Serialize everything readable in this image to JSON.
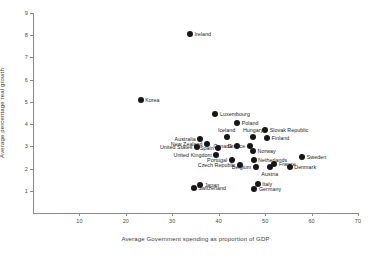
{
  "chart_data": {
    "type": "scatter",
    "title": "",
    "xlabel": "Average Government spending as proportion of GDP",
    "ylabel": "Average percentage real growth",
    "xlim": [
      0,
      70
    ],
    "ylim": [
      0,
      9
    ],
    "xticks": [
      10,
      20,
      30,
      40,
      50,
      60,
      70
    ],
    "yticks": [
      1,
      2,
      3,
      4,
      5,
      6,
      7,
      8,
      9
    ],
    "grid": false,
    "legend": "none",
    "marker": "filled-circle",
    "marker_color": "#161616",
    "points": [
      {
        "label": "Ireland",
        "x": 33.8,
        "y": 8.05,
        "lpos": "right"
      },
      {
        "label": "Korea",
        "x": 23.2,
        "y": 5.1,
        "lpos": "right"
      },
      {
        "label": "Luxembourg",
        "x": 39.3,
        "y": 4.45,
        "lpos": "right"
      },
      {
        "label": "Poland",
        "x": 44.0,
        "y": 4.05,
        "lpos": "right"
      },
      {
        "label": "Slovak Republic",
        "x": 50.0,
        "y": 3.72,
        "lpos": "right"
      },
      {
        "label": "Hungary",
        "x": 47.4,
        "y": 3.4,
        "lpos": "top"
      },
      {
        "label": "Finland",
        "x": 50.4,
        "y": 3.38,
        "lpos": "right"
      },
      {
        "label": "Iceland",
        "x": 41.7,
        "y": 3.42,
        "lpos": "top"
      },
      {
        "label": "Australia",
        "x": 36.0,
        "y": 3.32,
        "lpos": "left"
      },
      {
        "label": "New Zealand",
        "x": 37.5,
        "y": 3.12,
        "lpos": "left"
      },
      {
        "label": "United States",
        "x": 35.3,
        "y": 2.95,
        "lpos": "left"
      },
      {
        "label": "Spain",
        "x": 39.9,
        "y": 2.92,
        "lpos": "left"
      },
      {
        "label": "Canada",
        "x": 43.9,
        "y": 3.0,
        "lpos": "left"
      },
      {
        "label": "Greece",
        "x": 46.7,
        "y": 3.02,
        "lpos": "left"
      },
      {
        "label": "Norway",
        "x": 47.4,
        "y": 2.78,
        "lpos": "right"
      },
      {
        "label": "Sweden",
        "x": 58.0,
        "y": 2.52,
        "lpos": "right"
      },
      {
        "label": "United Kingdom",
        "x": 39.5,
        "y": 2.6,
        "lpos": "left"
      },
      {
        "label": "Portugal",
        "x": 42.8,
        "y": 2.4,
        "lpos": "left"
      },
      {
        "label": "Netherlands",
        "x": 47.5,
        "y": 2.38,
        "lpos": "right"
      },
      {
        "label": "Czech Republic",
        "x": 44.6,
        "y": 2.18,
        "lpos": "left"
      },
      {
        "label": "Belgium",
        "x": 48.0,
        "y": 2.08,
        "lpos": "left"
      },
      {
        "label": "Austria",
        "x": 51.0,
        "y": 2.05,
        "lpos": "bottom"
      },
      {
        "label": "France",
        "x": 52.0,
        "y": 2.22,
        "lpos": "right"
      },
      {
        "label": "Denmark",
        "x": 55.3,
        "y": 2.05,
        "lpos": "right"
      },
      {
        "label": "Japan",
        "x": 36.0,
        "y": 1.28,
        "lpos": "right"
      },
      {
        "label": "Switzerland",
        "x": 34.6,
        "y": 1.12,
        "lpos": "right"
      },
      {
        "label": "Italy",
        "x": 48.4,
        "y": 1.32,
        "lpos": "right"
      },
      {
        "label": "Germany",
        "x": 47.7,
        "y": 1.1,
        "lpos": "right"
      }
    ]
  }
}
